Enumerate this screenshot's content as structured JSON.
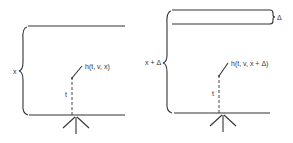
{
  "diagram": {
    "colors": {
      "ink": "#333333",
      "background": "#ffffff"
    },
    "left_panel": {
      "thickness_label": "x",
      "path_length_label": "t",
      "exit_label": "h(t, v, x)"
    },
    "right_panel": {
      "thickness_label": "x + Δ",
      "extra_layer_label": "Δ",
      "path_length_label": "t",
      "exit_label": "h(t, v, x + Δ)"
    }
  }
}
